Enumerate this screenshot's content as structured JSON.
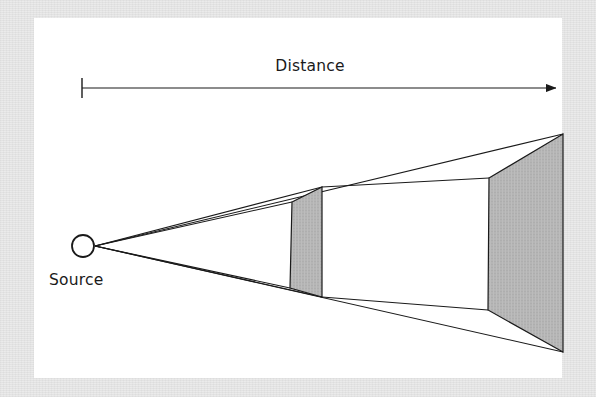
{
  "figure": {
    "name": "inverse-square-law-diagram",
    "type": "schematic-diagram",
    "background_color": "#e9e9e9",
    "canvas_color": "#ffffff",
    "stroke_color": "#1a1a1a",
    "fill_color": "#b5b5b5"
  },
  "labels": {
    "distance": "Distance",
    "source": "Source"
  },
  "axis": {
    "name": "distance-arrow",
    "start_x": 82,
    "end_x": 560,
    "y": 88,
    "tick_height": 20,
    "arrowhead": "right"
  },
  "source": {
    "name": "point-source",
    "cx": 83,
    "cy": 246,
    "r": 11
  },
  "panels": [
    {
      "name": "near-panel",
      "index": 1,
      "fill": "#b5b5b5",
      "points": "292,202 322,187 322,297 290,288"
    },
    {
      "name": "far-panel",
      "index": 2,
      "fill": "#b5b5b5",
      "points": "489,178 563,134 563,352 488,310"
    }
  ],
  "rays": [
    {
      "name": "upper-ray",
      "from_x": 95,
      "from_y": 246,
      "to_x": 563,
      "to_y": 134
    },
    {
      "name": "lower-ray",
      "from_x": 95,
      "from_y": 246,
      "to_x": 563,
      "to_y": 352
    },
    {
      "name": "upper-inner-ray",
      "from_x": 95,
      "from_y": 246,
      "to_x": 292,
      "to_y": 202
    },
    {
      "name": "lower-inner-ray",
      "from_x": 95,
      "from_y": 246,
      "to_x": 290,
      "to_y": 288
    }
  ],
  "connectors": [
    {
      "name": "top-connector",
      "from_x": 322,
      "from_y": 187,
      "to_x": 489,
      "to_y": 178
    },
    {
      "name": "bottom-connector",
      "from_x": 322,
      "from_y": 297,
      "to_x": 488,
      "to_y": 310
    }
  ]
}
